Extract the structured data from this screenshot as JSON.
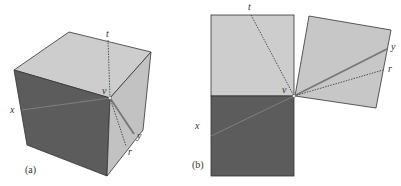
{
  "figure": {
    "panel_a": {
      "caption": "(a)",
      "labels": {
        "t": "t",
        "v": "v",
        "x": "x",
        "y": "y",
        "r": "r"
      }
    },
    "panel_b": {
      "caption": "(b)",
      "labels": {
        "t": "t",
        "v": "v",
        "x": "x",
        "y": "y",
        "r": "r"
      }
    },
    "colors": {
      "light_face": "#c9c9c9",
      "dark_face": "#5a5a5a",
      "edge": "#333333",
      "line": "#7a7a7a"
    }
  }
}
